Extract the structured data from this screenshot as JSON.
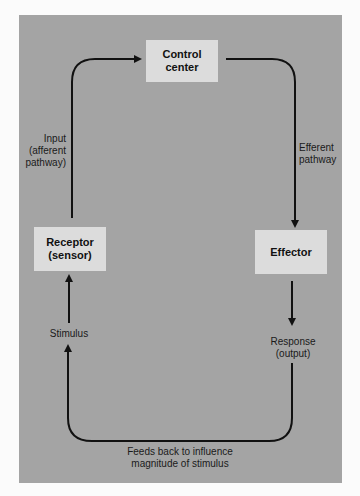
{
  "colors": {
    "background": "#a4a4a4",
    "box": "#dcdcdc",
    "line": "#111111"
  },
  "nodes": {
    "control_center": {
      "line1": "Control",
      "line2": "center"
    },
    "receptor": {
      "line1": "Receptor",
      "line2": "(sensor)"
    },
    "effector": {
      "line1": "Effector"
    }
  },
  "labels": {
    "input": {
      "line1": "Input",
      "line2": "(afferent",
      "line3": "pathway)"
    },
    "efferent": {
      "line1": "Efferent",
      "line2": "pathway"
    },
    "stimulus": "Stimulus",
    "response": {
      "line1": "Response",
      "line2": "(output)"
    },
    "feedback": {
      "line1": "Feeds back to influence",
      "line2": "magnitude of stimulus"
    }
  }
}
